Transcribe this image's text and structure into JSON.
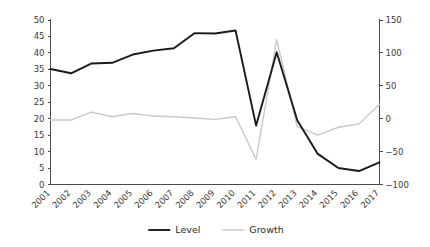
{
  "chart_data": {
    "type": "line",
    "title": "",
    "subtitle": "",
    "xlabel": "",
    "ylabel": "",
    "y2label": "",
    "grid": false,
    "legend_position": "bottom",
    "categories": [
      "2001",
      "2002",
      "2003",
      "2004",
      "2005",
      "2006",
      "2007",
      "2008",
      "2009",
      "2010",
      "2011",
      "2012",
      "2013",
      "2014",
      "2015",
      "2016",
      "2017"
    ],
    "x_tick_rotation": -45,
    "ylim": [
      0,
      50
    ],
    "y_ticks": [
      0,
      5,
      10,
      15,
      20,
      25,
      30,
      35,
      40,
      45,
      50
    ],
    "y2lim": [
      -100,
      150
    ],
    "y2_ticks": [
      -100,
      -50,
      0,
      50,
      100,
      150
    ],
    "y2_tick_labels": [
      "−100",
      "−50",
      "0",
      "50",
      "100",
      "150"
    ],
    "series": [
      {
        "name": "Level",
        "axis": "left",
        "color": "#1a1a1a",
        "values": [
          35.1,
          33.8,
          36.8,
          37.0,
          39.5,
          40.7,
          41.4,
          46.0,
          45.9,
          46.8,
          17.9,
          40.2,
          19.5,
          9.3,
          5.0,
          4.1,
          6.7
        ]
      },
      {
        "name": "Growth",
        "axis": "right",
        "color": "#c9c9c9",
        "values": [
          -2,
          -2,
          10,
          3,
          8,
          4,
          3,
          1,
          -1,
          3,
          -62,
          120,
          -12,
          -25,
          -13,
          -8,
          22
        ]
      }
    ]
  },
  "legend": {
    "items": [
      {
        "label": "Level"
      },
      {
        "label": "Growth"
      }
    ]
  }
}
